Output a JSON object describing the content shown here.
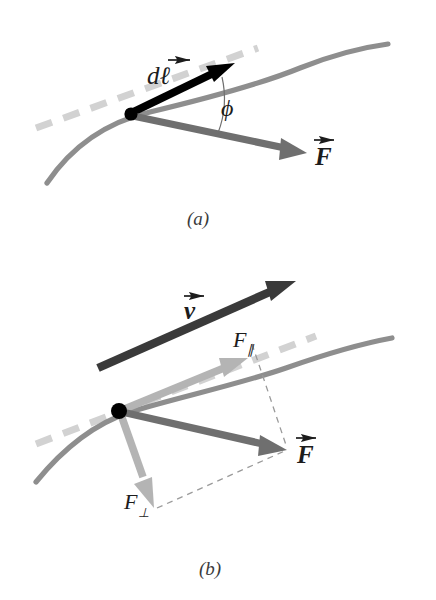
{
  "figure": {
    "type": "physics-vector-diagram",
    "background_color": "#ffffff",
    "panels": [
      {
        "id": "a",
        "caption": "(a)",
        "description": "Infinitesimal displacement vector along a curved path with an applied force at angle phi to the tangent.",
        "labels": {
          "displacement": "dℓ",
          "force": "F",
          "angle": "ϕ"
        }
      },
      {
        "id": "b",
        "caption": "(b)",
        "description": "Velocity vector tangent to the path with the force resolved into parallel and perpendicular components.",
        "labels": {
          "velocity": "v",
          "force": "F",
          "force_parallel_base": "F",
          "force_parallel_sub": "∥",
          "force_perp_base": "F",
          "force_perp_sub": "⊥"
        }
      }
    ],
    "colors": {
      "path_curve": "#8e8e8e",
      "tangent_dashed": "#d2d2d2",
      "displacement_arrow": "#000000",
      "force_arrow": "#6f6f6f",
      "velocity_arrow": "#3a3a3a",
      "component_arrow": "#b4b4b4",
      "construction_dashed": "#9a9a9a",
      "point_dot": "#000000",
      "angle_arc": "#6f6f6f",
      "label_text": "#1c1c1c",
      "caption_text": "#3b3b3b"
    },
    "vector_arrow_accent": "→"
  }
}
